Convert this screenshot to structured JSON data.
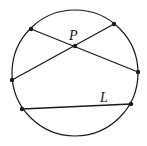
{
  "diagram": {
    "type": "geometry",
    "colors": {
      "stroke": "#1a1a1a",
      "background": "#ffffff"
    },
    "circle": {
      "cx": 75,
      "cy": 73,
      "r": 63
    },
    "points": {
      "A": {
        "x": 31,
        "y": 29
      },
      "B": {
        "x": 114,
        "y": 24
      },
      "C": {
        "x": 138,
        "y": 72
      },
      "D": {
        "x": 12,
        "y": 80
      },
      "P": {
        "x": 75,
        "y": 46
      },
      "E": {
        "x": 22,
        "y": 109
      },
      "F": {
        "x": 131,
        "y": 104
      }
    },
    "chords": [
      {
        "from": "A",
        "to": "C",
        "passes_through": "P"
      },
      {
        "from": "D",
        "to": "B",
        "passes_through": "P"
      },
      {
        "from": "E",
        "to": "F",
        "label": "L"
      }
    ],
    "labels": {
      "p": {
        "text": "P",
        "x": 69,
        "y": 40
      },
      "l": {
        "text": "L",
        "x": 100,
        "y": 102
      }
    }
  }
}
